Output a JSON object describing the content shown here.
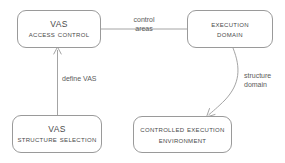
{
  "diagram": {
    "background_color": "#ffffff",
    "stroke_color": "#9a9a9a",
    "text_color": "#4a4a4a",
    "label_color": "#5a5a5a",
    "nodes": [
      {
        "id": "vas-access-control",
        "line1": "VAS",
        "line2": "Access Control",
        "x": 17,
        "y": 10,
        "width": 84,
        "height": 38
      },
      {
        "id": "execution-domain",
        "line1": "Execution",
        "line2": "Domain",
        "x": 187,
        "y": 10,
        "width": 86,
        "height": 38
      },
      {
        "id": "vas-structure-selection",
        "line1": "VAS",
        "line2": "Structure Selection",
        "x": 12,
        "y": 115,
        "width": 90,
        "height": 38
      },
      {
        "id": "controlled-execution-environment",
        "line1": "Controlled Execution",
        "line2": "Environment",
        "x": 133,
        "y": 116,
        "width": 99,
        "height": 37
      }
    ],
    "edges": [
      {
        "id": "control-areas",
        "from": "vas-access-control",
        "to": "execution-domain",
        "label_line1": "control",
        "label_line2": "areas",
        "arrow": false
      },
      {
        "id": "define-vas",
        "from": "vas-structure-selection",
        "to": "vas-access-control",
        "label_line1": "define VAS",
        "label_line2": "",
        "arrow": true
      },
      {
        "id": "structure-domain",
        "from": "execution-domain",
        "to": "controlled-execution-environment",
        "label_line1": "structure",
        "label_line2": "domain",
        "arrow": true
      }
    ]
  }
}
